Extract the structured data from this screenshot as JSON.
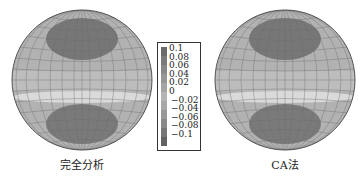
{
  "figure": {
    "panels": [
      {
        "id": "left",
        "caption": "完全分析"
      },
      {
        "id": "right",
        "caption": "CA法"
      }
    ],
    "legend": {
      "ticks": [
        "0.1",
        "0.08",
        "0.06",
        "0.04",
        "0.02",
        "0",
        "−0.02",
        "−0.04",
        "−0.06",
        "−0.08",
        "−0.1"
      ],
      "colors": [
        "#6a6a6a",
        "#7a7a7a",
        "#888888",
        "#969696",
        "#a4a4a4",
        "#b4b4b4",
        "#a8a8a8",
        "#989898",
        "#888888",
        "#767676",
        "#626262",
        "#555555"
      ]
    },
    "colors": {
      "sphere_base": "#b3b3b3",
      "dark_region": "#737373",
      "light_band": "#d6d6d6",
      "grid": "#6d6d6d"
    }
  }
}
